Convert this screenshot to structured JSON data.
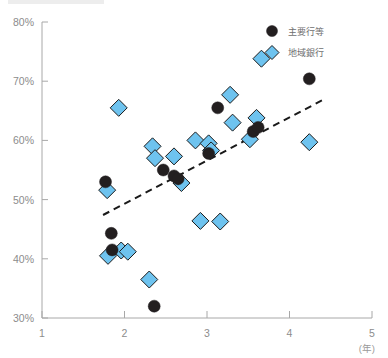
{
  "chart_data": {
    "type": "scatter",
    "title": "",
    "xlabel": "(年)",
    "ylabel": "",
    "xlim": [
      1,
      5
    ],
    "ylim": [
      30,
      80
    ],
    "xticks": [
      "1",
      "2",
      "3",
      "4",
      "5"
    ],
    "yticks": [
      "30%",
      "40%",
      "50%",
      "60%",
      "70%",
      "80%"
    ],
    "grid": false,
    "legend_position": "top-right",
    "series": [
      {
        "name": "主要行等",
        "marker": "circle",
        "color": "#231f20",
        "points": [
          [
            1.77,
            53.0
          ],
          [
            1.84,
            44.3
          ],
          [
            1.85,
            41.5
          ],
          [
            2.36,
            32.0
          ],
          [
            2.47,
            55.0
          ],
          [
            2.6,
            54.0
          ],
          [
            2.65,
            53.5
          ],
          [
            3.02,
            57.8
          ],
          [
            3.13,
            65.5
          ],
          [
            3.56,
            61.5
          ],
          [
            3.62,
            62.2
          ],
          [
            4.24,
            70.4
          ]
        ]
      },
      {
        "name": "地域銀行",
        "marker": "diamond",
        "color": "#6ec3ef",
        "points": [
          [
            1.79,
            51.6
          ],
          [
            1.8,
            40.5
          ],
          [
            1.93,
            65.5
          ],
          [
            1.96,
            41.4
          ],
          [
            2.04,
            41.2
          ],
          [
            2.3,
            36.5
          ],
          [
            2.34,
            59.0
          ],
          [
            2.37,
            57.0
          ],
          [
            2.6,
            57.3
          ],
          [
            2.69,
            52.8
          ],
          [
            2.86,
            60.0
          ],
          [
            2.92,
            46.4
          ],
          [
            3.02,
            59.5
          ],
          [
            3.05,
            58.3
          ],
          [
            3.16,
            46.3
          ],
          [
            3.28,
            67.7
          ],
          [
            3.31,
            63.0
          ],
          [
            3.52,
            60.2
          ],
          [
            3.6,
            63.8
          ],
          [
            3.66,
            73.8
          ],
          [
            4.24,
            59.7
          ]
        ]
      }
    ],
    "trendline": {
      "x_start": 1.74,
      "y_start": 47.4,
      "x_end": 4.4,
      "y_end": 66.8,
      "style": "dashed",
      "color": "#1a1a1a"
    }
  },
  "legend": {
    "items": [
      {
        "label": "主要行等",
        "marker": "circle"
      },
      {
        "label": "地域銀行",
        "marker": "diamond"
      }
    ]
  },
  "axes": {
    "y_ticks": [
      "80%",
      "70%",
      "60%",
      "50%",
      "40%",
      "30%"
    ],
    "x_ticks": [
      "1",
      "2",
      "3",
      "4",
      "5"
    ],
    "x_unit": "(年)"
  }
}
